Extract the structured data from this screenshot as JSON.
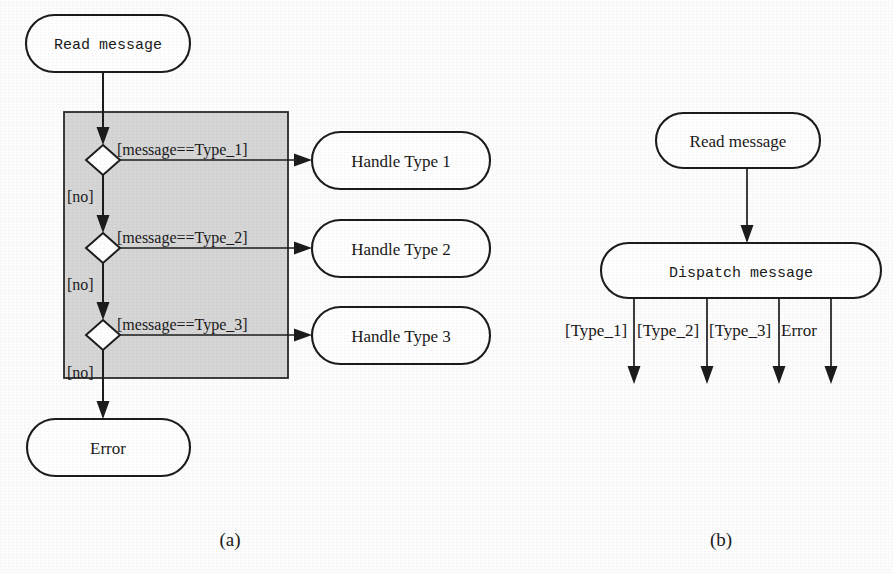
{
  "figure": {
    "caption_a": "(a)",
    "caption_b": "(b)"
  },
  "diagram_a": {
    "start_node": "Read message",
    "error_node": "Error",
    "no_labels": [
      "[no]",
      "[no]",
      "[no]"
    ],
    "decisions": [
      {
        "guard": "[message==Type_1]",
        "target": "Handle Type 1"
      },
      {
        "guard": "[message==Type_2]",
        "target": "Handle Type 2"
      },
      {
        "guard": "[message==Type_3]",
        "target": "Handle Type 3"
      }
    ],
    "handlers": [
      "Handle Type 1",
      "Handle Type 2",
      "Handle Type 3"
    ],
    "guards": [
      "[message==Type_1]",
      "[message==Type_2]",
      "[message==Type_3]"
    ]
  },
  "diagram_b": {
    "start_node": "Read message",
    "dispatch_node": "Dispatch message",
    "branch_labels": [
      "[Type_1]",
      "[Type_2]",
      "[Type_3]",
      "Error"
    ]
  },
  "colors": {
    "page_background": "#fdfdfd",
    "region_fill": "#d6d6d6",
    "node_fill": "#ffffff",
    "stroke": "#1c1c1c",
    "text": "#1a1a1a"
  }
}
